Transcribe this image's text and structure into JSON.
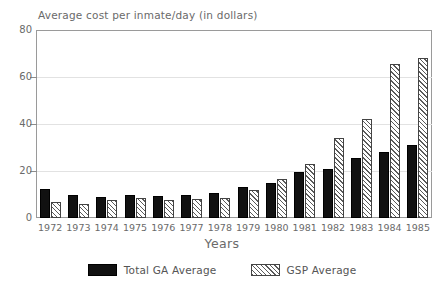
{
  "chart_data": {
    "type": "bar",
    "title": "Average cost per inmate/day (in dollars)",
    "xlabel": "Years",
    "ylabel": "",
    "ylim": [
      0,
      80
    ],
    "yticks": [
      0,
      20,
      40,
      60,
      80
    ],
    "grid": true,
    "legend_position": "bottom",
    "categories": [
      "1972",
      "1973",
      "1974",
      "1975",
      "1976",
      "1977",
      "1978",
      "1979",
      "1980",
      "1981",
      "1982",
      "1983",
      "1984",
      "1985"
    ],
    "series": [
      {
        "name": "Total GA Average",
        "color": "#111111",
        "fill": "solid",
        "values": [
          12.5,
          10.0,
          9.0,
          10.0,
          9.5,
          10.0,
          10.5,
          13.0,
          15.0,
          19.5,
          21.0,
          25.5,
          28.0,
          31.0
        ]
      },
      {
        "name": "GSP Average",
        "color": "#ffffff",
        "fill": "diagonal-hatch",
        "values": [
          7.0,
          6.0,
          7.5,
          8.5,
          7.5,
          8.0,
          8.5,
          12.0,
          16.5,
          23.0,
          34.0,
          42.0,
          65.5,
          68.0
        ]
      }
    ]
  },
  "axes": {
    "y_tick_labels": [
      "80",
      "60",
      "40",
      "20",
      "0"
    ],
    "x_tick_labels": [
      "1972",
      "1973",
      "1974",
      "1975",
      "1976",
      "1977",
      "1978",
      "1979",
      "1980",
      "1981",
      "1982",
      "1983",
      "1984",
      "1985"
    ]
  },
  "legend": {
    "items": [
      {
        "label": "Total GA Average",
        "swatch": "solid-black"
      },
      {
        "label": "GSP Average",
        "swatch": "hatched"
      }
    ]
  }
}
